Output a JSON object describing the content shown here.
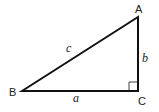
{
  "diagram": {
    "vertices": [
      {
        "id": "A",
        "label": "A",
        "x": 138,
        "y": 17
      },
      {
        "id": "B",
        "label": "B",
        "x": 22,
        "y": 91
      },
      {
        "id": "C",
        "label": "C",
        "x": 138,
        "y": 91
      }
    ],
    "sides": [
      {
        "id": "a",
        "label": "a",
        "from": "B",
        "to": "C"
      },
      {
        "id": "b",
        "label": "b",
        "from": "C",
        "to": "A"
      },
      {
        "id": "c",
        "label": "c",
        "from": "B",
        "to": "A"
      }
    ],
    "right_angle_at": "C",
    "labels": {
      "A": "A",
      "B": "B",
      "C": "C",
      "a": "a",
      "b": "b",
      "c": "c"
    },
    "colors": {
      "stroke": "#111111",
      "text": "#222222",
      "background": "#ffffff"
    }
  }
}
